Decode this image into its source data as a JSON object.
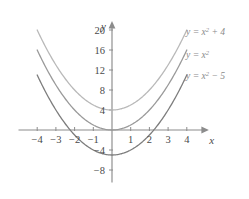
{
  "figure": {
    "name": "parabola-translations-graph",
    "width": 249,
    "height": 199,
    "background": "#ffffff"
  },
  "axes": {
    "x_axis_label": "x",
    "y_axis_label": "y",
    "x_ticks": [
      {
        "value": -4,
        "label": "−4"
      },
      {
        "value": -3,
        "label": "−3"
      },
      {
        "value": -2,
        "label": "−2"
      },
      {
        "value": -1,
        "label": "−1"
      },
      {
        "value": 1,
        "label": "1"
      },
      {
        "value": 2,
        "label": "2"
      },
      {
        "value": 3,
        "label": "3"
      },
      {
        "value": 4,
        "label": "4"
      }
    ],
    "y_ticks": [
      {
        "value": 20,
        "label": "20"
      },
      {
        "value": 16,
        "label": "16"
      },
      {
        "value": 12,
        "label": "12"
      },
      {
        "value": 8,
        "label": "8"
      },
      {
        "value": 4,
        "label": "4"
      },
      {
        "value": -4,
        "label": "−4"
      },
      {
        "value": -8,
        "label": "−8"
      }
    ],
    "axis_color": "#8c8c8c"
  },
  "legend": {
    "position": "right-inline",
    "entries": [
      {
        "name": "legend-label-x2-plus-4",
        "prefix": "y = x",
        "exponent": "2",
        "suffix": " + 4",
        "color": "#b9b9b9"
      },
      {
        "name": "legend-label-x2",
        "prefix": "y = x",
        "exponent": "2",
        "suffix": "",
        "color": "#9a9a9a"
      },
      {
        "name": "legend-label-x2-minus-5",
        "prefix": "y = x",
        "exponent": "2",
        "suffix": " − 5",
        "color": "#7d7d7d"
      }
    ]
  },
  "chart_data": {
    "type": "line",
    "title": "",
    "subtitle": "",
    "xlabel": "x",
    "ylabel": "y",
    "xlim": [
      -5.0,
      5.1
    ],
    "ylim": [
      -10.5,
      21.5
    ],
    "grid": false,
    "legend_position": "right-inline",
    "x": [
      -4,
      -3.5,
      -3,
      -2.5,
      -2,
      -1.5,
      -1,
      -0.5,
      0,
      0.5,
      1,
      1.5,
      2,
      2.5,
      3,
      3.5,
      4
    ],
    "series": [
      {
        "name": "y = x² + 4",
        "equation": "y = x^2 + 4",
        "vertex": [
          0,
          4
        ],
        "color": "#b9b9b9",
        "stroke_width": 1.3,
        "values": [
          20,
          16.25,
          13,
          10.25,
          8,
          6.25,
          5,
          4.25,
          4,
          4.25,
          5,
          6.25,
          8,
          10.25,
          13,
          16.25,
          20
        ]
      },
      {
        "name": "y = x²",
        "equation": "y = x^2",
        "vertex": [
          0,
          0
        ],
        "color": "#9a9a9a",
        "stroke_width": 1.3,
        "values": [
          16,
          12.25,
          9,
          6.25,
          4,
          2.25,
          1,
          0.25,
          0,
          0.25,
          1,
          2.25,
          4,
          6.25,
          9,
          12.25,
          16
        ]
      },
      {
        "name": "y = x² − 5",
        "equation": "y = x^2 - 5",
        "vertex": [
          0,
          -5
        ],
        "color": "#7d7d7d",
        "stroke_width": 1.3,
        "values": [
          11,
          7.25,
          4,
          1.25,
          -1,
          -2.75,
          -4,
          -4.75,
          -5,
          -4.75,
          -4,
          -2.75,
          -1,
          1.25,
          4,
          7.25,
          11
        ]
      }
    ]
  }
}
